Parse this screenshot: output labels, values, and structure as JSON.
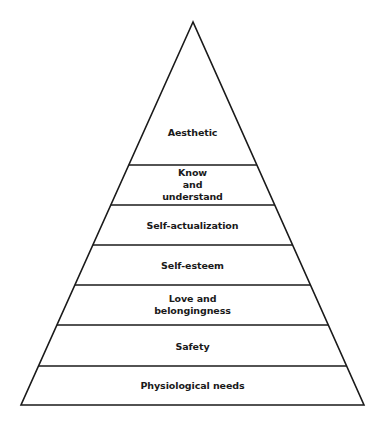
{
  "diagram": {
    "type": "pyramid",
    "title": "",
    "stroke_color": "#1a1a1a",
    "fill_color": "#ffffff",
    "apex": {
      "x": 193,
      "y": 22
    },
    "base_left": {
      "x": 21,
      "y": 405
    },
    "base_right": {
      "x": 364,
      "y": 405
    },
    "divider_y": [
      165,
      205,
      245,
      285,
      325,
      366
    ],
    "levels": [
      {
        "label": "Aesthetic",
        "order": 7
      },
      {
        "label": "Know\nand\nunderstand",
        "order": 6
      },
      {
        "label": "Self-actualization",
        "order": 5
      },
      {
        "label": "Self-esteem",
        "order": 4
      },
      {
        "label": "Love and\nbelongingness",
        "order": 3
      },
      {
        "label": "Safety",
        "order": 2
      },
      {
        "label": "Physiological needs",
        "order": 1
      }
    ]
  }
}
